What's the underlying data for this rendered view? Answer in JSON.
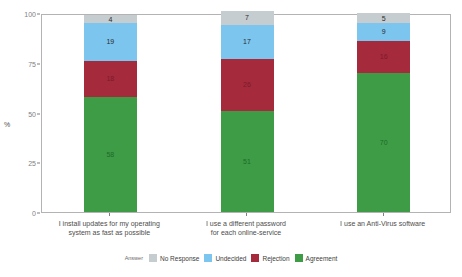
{
  "chart_data": {
    "type": "bar",
    "subtype": "stacked-percent",
    "title": "",
    "subtitle": "",
    "xlabel": "",
    "ylabel": "%",
    "ylim": [
      0,
      100
    ],
    "yticks": [
      0,
      25,
      50,
      75,
      100
    ],
    "ytick_labels": [
      "0",
      "25",
      "50",
      "75",
      "100"
    ],
    "grid": false,
    "legend_position": "bottom",
    "legend_title": "Answer",
    "categories": [
      "I install updates for my operating system as fast as possible",
      "I use a different password for each online-service",
      "I use an Anti-Virus software"
    ],
    "category_lines": [
      [
        "I install updates for my operating",
        "system as fast as possible"
      ],
      [
        "I use a different password",
        "for each online-service"
      ],
      [
        "I use an Anti-Virus software"
      ]
    ],
    "series": [
      {
        "name": "Agreement",
        "color": "#3f9c46",
        "values": [
          58,
          51,
          70
        ]
      },
      {
        "name": "Rejection",
        "color": "#a52a3c",
        "values": [
          18,
          26,
          16
        ]
      },
      {
        "name": "Undecided",
        "color": "#7cc5ef",
        "values": [
          19,
          17,
          9
        ]
      },
      {
        "name": "No Response",
        "color": "#c6cdd1",
        "values": [
          4,
          7,
          5
        ]
      }
    ],
    "legend_order": [
      "No Response",
      "Undecided",
      "Rejection",
      "Agreement"
    ]
  },
  "colors": {
    "no_response": "#c6cdd1",
    "undecided": "#7cc5ef",
    "rejection": "#a52a3c",
    "agreement": "#3f9c46",
    "panel_border": "#b3b3b3",
    "axis_text": "#7f7f7f",
    "label_text": "#4d4d4d",
    "background": "#ffffff"
  }
}
